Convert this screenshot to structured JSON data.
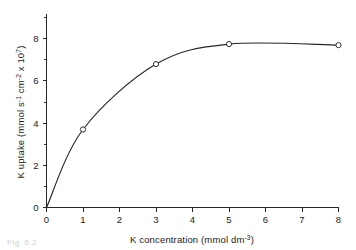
{
  "figure": {
    "caption_fragment": "Fig. 6.2",
    "background_color": "#ffffff",
    "ink_color": "#262626"
  },
  "chart_data": {
    "type": "line",
    "title": "",
    "subtitle": "",
    "xlabel": "K concentration (mmol dm",
    "xlabel_exponent": "-3",
    "xlabel_tail": ")",
    "ylabel_part1": "K uptake (mmol s",
    "ylabel_exp1": "-1",
    "ylabel_part2": " cm",
    "ylabel_exp2": "-2",
    "ylabel_part3": " x 10",
    "ylabel_exp3": "7",
    "ylabel_tail": ")",
    "x": [
      0,
      1,
      3,
      5,
      8
    ],
    "values": [
      0,
      3.7,
      6.8,
      7.75,
      7.7
    ],
    "marker_points": [
      {
        "x": 1,
        "y": 3.7
      },
      {
        "x": 3,
        "y": 6.8
      },
      {
        "x": 5,
        "y": 7.75
      },
      {
        "x": 8,
        "y": 7.7
      }
    ],
    "xlim": [
      0,
      8
    ],
    "ylim": [
      0,
      9.2
    ],
    "xticks": [
      0,
      1,
      2,
      3,
      4,
      5,
      6,
      7,
      8
    ],
    "xticklabels": [
      "0",
      "1",
      "2",
      "3",
      "4",
      "5",
      "6",
      "7",
      "8"
    ],
    "yticks": [
      0,
      2,
      4,
      6,
      8
    ],
    "yticklabels": [
      "0",
      "2",
      "4",
      "6",
      "8"
    ],
    "yminorticks": [
      1,
      3,
      5,
      7,
      9
    ],
    "grid": false,
    "legend": false,
    "marker_style": "open-circle",
    "line_color": "#262626"
  }
}
